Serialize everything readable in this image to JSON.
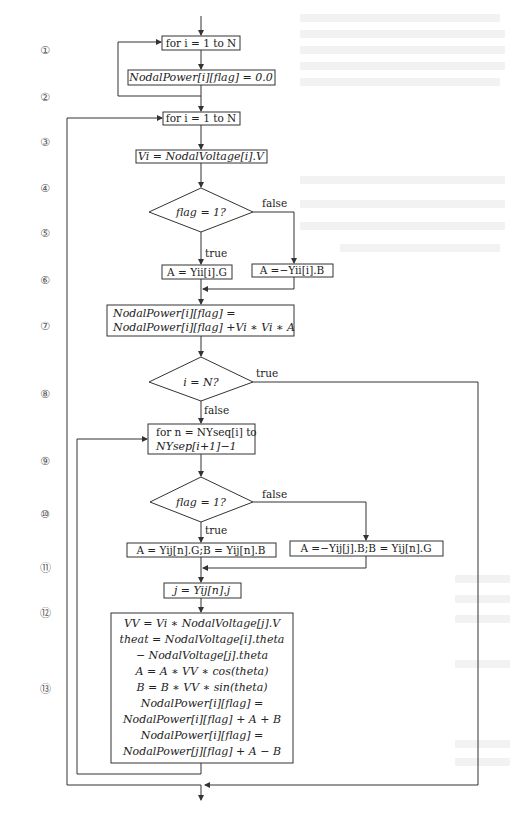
{
  "diagram": {
    "type": "flowchart",
    "steps": [
      "①",
      "②",
      "③",
      "④",
      "⑤",
      "⑥",
      "⑦",
      "⑧",
      "⑨",
      "⑩",
      "⑪",
      "⑫",
      "⑬"
    ],
    "nodes": {
      "loop1": "for i = 1 to N",
      "init": "NodalPower[i][flag] = 0.0",
      "loop2": "for i = 1 to N",
      "vi": "Vi = NodalVoltage[i].V",
      "cond1": "flag = 1?",
      "a_true": "A = Yii[i].G",
      "a_false": "A =−Yii[i].B",
      "acc_line1": "NodalPower[i][flag] =",
      "acc_line2": "NodalPower[i][flag] +Vi ∗ Vi ∗ A",
      "cond2": "i = N?",
      "loop3_line1": "for n = NYseq[i] to",
      "loop3_line2": "NYsep[i+1]−1",
      "cond3": "flag = 1?",
      "ab_true": "A = Yij[n].G;B = Yij[n].B",
      "ab_false": "A =−Yij[j].B;B = Yij[n].G",
      "j_assign": "j = Yij[n].j",
      "calc_lines": [
        "VV = Vi ∗ NodalVoltage[j].V",
        "theat = NodalVoltage[i].theta",
        "− NodalVoltage[j].theta",
        "A = A ∗ VV ∗ cos(theta)",
        "B = B ∗ VV ∗ sin(theta)",
        "NodalPower[i][flag] =",
        "NodalPower[i][flag] + A + B",
        "NodalPower[i][flag] =",
        "NodalPower[j][flag] + A − B"
      ]
    },
    "edge_labels": {
      "true": "true",
      "false": "false"
    }
  }
}
